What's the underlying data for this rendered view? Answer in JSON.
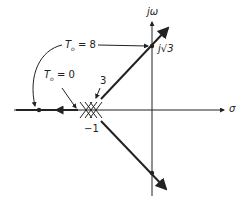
{
  "diagram": {
    "type": "root-locus",
    "axes": {
      "horizontal": "σ",
      "vertical": "jω"
    },
    "labels": {
      "t8": "T",
      "t8_sub": "o",
      "t8_val": "= 8",
      "t0": "T",
      "t0_sub": "o",
      "t0_val": "= 0",
      "jsqrt3": "j√3",
      "multiplicity": "3",
      "neg_one": "−1"
    },
    "points": [
      {
        "name": "triple-pole",
        "re": -1,
        "im": 0,
        "multiplicity": 3
      },
      {
        "name": "imag-crossing-upper",
        "re": 0,
        "im": 1.732
      },
      {
        "name": "imag-crossing-lower",
        "re": 0,
        "im": -1.732
      },
      {
        "name": "real-axis-point",
        "re": -3,
        "im": 0
      }
    ]
  }
}
